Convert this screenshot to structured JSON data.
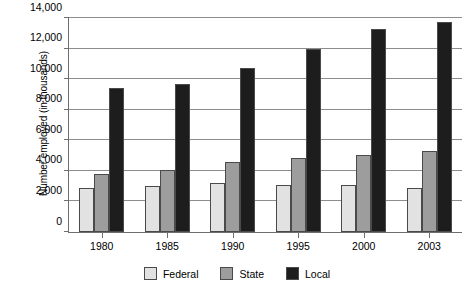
{
  "chart_data": {
    "type": "bar",
    "title": "",
    "xlabel": "",
    "ylabel": "Number employed (in thousands)",
    "categories": [
      "1980",
      "1985",
      "1990",
      "1995",
      "2000",
      "2003"
    ],
    "series": [
      {
        "name": "Federal",
        "color": "#e2e2e2",
        "values": [
          2900,
          3000,
          3200,
          3100,
          3100,
          2900
        ]
      },
      {
        "name": "State",
        "color": "#9d9d9d",
        "values": [
          3800,
          4050,
          4600,
          4850,
          5050,
          5300
        ]
      },
      {
        "name": "Local",
        "color": "#1d1d1d",
        "values": [
          9400,
          9700,
          10700,
          11950,
          13250,
          13750
        ]
      }
    ],
    "ylim": [
      0,
      14000
    ],
    "y_ticks": [
      0,
      2000,
      4000,
      6000,
      8000,
      10000,
      12000,
      14000
    ],
    "y_tick_labels": [
      "0",
      "2,000",
      "4,000",
      "6,000",
      "8,000",
      "10,000",
      "12,000",
      "14,000"
    ],
    "grid": true,
    "legend_position": "bottom"
  },
  "axes": {
    "y_title": "Number employed (in thousands)"
  },
  "legend": {
    "items": [
      {
        "label": "Federal",
        "color": "#e2e2e2"
      },
      {
        "label": "State",
        "color": "#9d9d9d"
      },
      {
        "label": "Local",
        "color": "#1d1d1d"
      }
    ]
  }
}
